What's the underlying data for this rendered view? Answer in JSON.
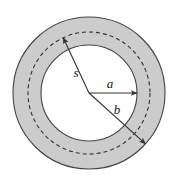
{
  "figure": {
    "name": "annulus-radius-diagram",
    "background_color": "#ffffff",
    "canvas": {
      "width": 179,
      "height": 183
    },
    "center": {
      "x": 89,
      "y": 93
    },
    "shapes": {
      "outer_circle": {
        "name": "outer-boundary-circle",
        "radius": 76,
        "fill": "#cccccc",
        "stroke": "#444444",
        "stroke_width": 1.1,
        "dash": "none"
      },
      "dashed_circle": {
        "name": "dashed-midline-circle",
        "radius": 61,
        "fill": "none",
        "stroke": "#333333",
        "stroke_width": 1.1,
        "dash": "4 3"
      },
      "inner_circle": {
        "name": "inner-boundary-circle",
        "radius": 48,
        "fill": "#ffffff",
        "stroke": "#444444",
        "stroke_width": 1.1,
        "dash": "none"
      }
    },
    "arrows": [
      {
        "id": "s",
        "name": "radius-arrow-s",
        "label": "s",
        "length": 61,
        "angle_deg": 115,
        "label_x": 76,
        "label_y": 77,
        "stroke": "#333333"
      },
      {
        "id": "a",
        "name": "radius-arrow-a",
        "label": "a",
        "length": 48,
        "angle_deg": 0,
        "label_x": 110,
        "label_y": 88,
        "stroke": "#333333"
      },
      {
        "id": "b",
        "name": "radius-arrow-b",
        "label": "b",
        "length": 76,
        "angle_deg": -42,
        "label_x": 117,
        "label_y": 114,
        "stroke": "#333333"
      }
    ]
  }
}
